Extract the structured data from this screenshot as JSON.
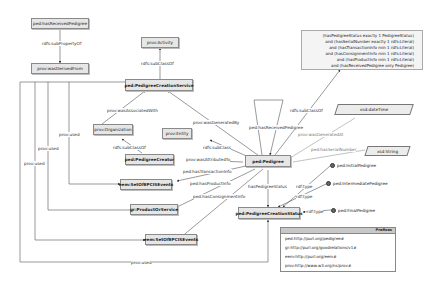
{
  "nodes": {
    "hasReceivedPedigree": "ped:hasReceivedPedigree",
    "wasDerivedFrom": "prov:wasDerivedFrom",
    "activity": "prov:Activity",
    "creationService": "ped:PedigreeCreationService",
    "organization": "prov:Organization",
    "entity": "prov:Entity",
    "pedigreeCreator": "ped:PedigreeCreator",
    "pedigree": "ped:Pedigree",
    "setOfEPCISEvents1": "eem:SetOfEPCISEvents",
    "productOrService": "gr:ProductOrService",
    "setOfEPCISEvents2": "eem:SetOfEPCISEvents",
    "creationStatus": "ped:PedigreeCreationStatus",
    "dateTime": "xsd:dateTime",
    "string": "xsd:String"
  },
  "individuals": {
    "initial": "ped:InitialPedigree",
    "intermediate": "ped:IntermediatePedigree",
    "final": "ped:FinalPedigree"
  },
  "edge_labels": {
    "subPropertyOf": "rdfs:subPropertyOf",
    "subClassOfActivity": "rdfs:subClassOf",
    "wasAssociatedWith": "prov:wasAssociatedWith",
    "wasGeneratedBy": "prov:wasGeneratedBy",
    "subClassOfOrg": "rdfs:subClassOf",
    "subClassEntity": "rdfs:subClass",
    "wasAttributedTo": "prov:wasAttributedTo",
    "hasTransactionInfo": "ped:hasTransactionInfo",
    "hasProductInfo": "ped:hasProductInfo",
    "hasConsignmentInfo": "ped:hasConsignmentInfo",
    "hasPedigreeStatus": "hasPedigreeStatus",
    "hasReceivedPedigreeLoop": "ped:hasReceivedPedigree",
    "subClassOfRestriction": "rdfs:subClassOf",
    "wasGeneratedAt": "prov:wasGeneratedAt",
    "hasSerialNumber": "ped:hasSerialNumber",
    "rdfType1": "rdf:type",
    "rdfType2": "rdf:type",
    "rdfType3": "rdf:type",
    "used1": "prov:used",
    "used2": "prov:used",
    "used3": "prov:used",
    "used4": "prov:used"
  },
  "restriction": [
    "(hasPedigreeStatus exactly 1 PedigreeStatus)",
    "and (hasSerialNumber exactly 1 rdfs:Literal)",
    "and (hasTransactionInfo min 1 rdfs:Literal)",
    "and (hasConsignmentInfo min 1 rdfs:Literal)",
    "and (hasProductInfo min 1 rdfs:Literal)",
    "and (hasReceivedPedigree only Pedigree)"
  ],
  "prefixes": {
    "title": "Prefixes",
    "rows": [
      "ped:http://purl.org/pedigree#",
      "gr:http://purl.org/goodrelations/v1#",
      "eem:http://purl.org/eem#",
      "prov:http://www.w3.org/ns/prov#"
    ]
  }
}
